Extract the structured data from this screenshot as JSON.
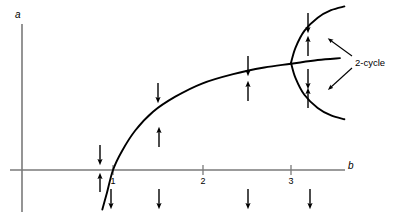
{
  "figure": {
    "title": "",
    "axes": {
      "y_label": "a",
      "x_label": "b",
      "x_ticks": [
        {
          "value": 1,
          "label": "1",
          "px": 113
        },
        {
          "value": 2,
          "label": "2",
          "px": 203
        },
        {
          "value": 3,
          "label": "3",
          "px": 291
        }
      ],
      "x_axis_y_px": 170,
      "y_axis_x_px": 22,
      "x_axis_start_px": 10,
      "x_axis_end_px": 345,
      "y_axis_top_px": 24,
      "y_axis_bottom_px": 212
    },
    "annotations": [
      {
        "name": "two-cycle-label",
        "text": "2-cycle",
        "x": 355,
        "y": 58
      }
    ],
    "colors": {
      "curve": "#000000",
      "axis": "#6e6e6e",
      "arrow": "#000000",
      "background": "#ffffff"
    }
  },
  "chart_data": {
    "type": "line",
    "title": "",
    "xlabel": "b",
    "ylabel": "a",
    "xlim": [
      0.0,
      3.6
    ],
    "ylim": [
      -0.45,
      1.7
    ],
    "grid": false,
    "legend": "none",
    "series": [
      {
        "name": "fixed-point-branch",
        "description": "nontrivial fixed point branch rising from b=1 through the transcritical point and continuing past b=3",
        "x": [
          0.88,
          0.93,
          1.0,
          1.1,
          1.25,
          1.45,
          1.7,
          2.0,
          2.35,
          2.7,
          3.0,
          3.3,
          3.55
        ],
        "y": [
          -0.42,
          -0.25,
          0.0,
          0.2,
          0.42,
          0.62,
          0.78,
          0.92,
          1.02,
          1.09,
          1.13,
          1.17,
          1.19
        ]
      },
      {
        "name": "two-cycle-upper-branch",
        "description": "upper arm of the period-doubling parabola opening rightward from the vertex at b=3",
        "x": [
          3.0,
          3.05,
          3.15,
          3.3,
          3.45,
          3.6
        ],
        "y": [
          1.14,
          1.3,
          1.48,
          1.62,
          1.7,
          1.74
        ]
      },
      {
        "name": "two-cycle-lower-branch",
        "description": "lower arm of the period-doubling parabola opening rightward from the vertex at b=3",
        "x": [
          3.0,
          3.05,
          3.15,
          3.3,
          3.45,
          3.6
        ],
        "y": [
          1.14,
          0.98,
          0.8,
          0.66,
          0.58,
          0.54
        ]
      }
    ],
    "arrows": [
      {
        "name": "arrow-1",
        "direction": "down",
        "x": 100,
        "y_top": 145,
        "y_bottom": 162
      },
      {
        "name": "arrow-2",
        "direction": "up",
        "x": 100,
        "y_top": 176,
        "y_bottom": 192
      },
      {
        "name": "arrow-3",
        "direction": "down",
        "x": 111,
        "y_top": 189,
        "y_bottom": 206
      },
      {
        "name": "arrow-4",
        "direction": "down",
        "x": 158,
        "y_top": 83,
        "y_bottom": 100
      },
      {
        "name": "arrow-5",
        "direction": "up",
        "x": 159,
        "y_top": 130,
        "y_bottom": 147
      },
      {
        "name": "arrow-6",
        "direction": "down",
        "x": 159,
        "y_top": 189,
        "y_bottom": 206
      },
      {
        "name": "arrow-7",
        "direction": "down",
        "x": 248,
        "y_top": 56,
        "y_bottom": 73
      },
      {
        "name": "arrow-8",
        "direction": "up",
        "x": 248,
        "y_top": 84,
        "y_bottom": 101
      },
      {
        "name": "arrow-9",
        "direction": "down",
        "x": 248,
        "y_top": 189,
        "y_bottom": 206
      },
      {
        "name": "arrow-10",
        "direction": "down",
        "x": 308,
        "y_top": 13,
        "y_bottom": 30
      },
      {
        "name": "arrow-11",
        "direction": "up",
        "x": 308,
        "y_top": 39,
        "y_bottom": 56
      },
      {
        "name": "arrow-12",
        "direction": "down",
        "x": 308,
        "y_top": 69,
        "y_bottom": 86
      },
      {
        "name": "arrow-13",
        "direction": "up",
        "x": 308,
        "y_top": 91,
        "y_bottom": 108
      },
      {
        "name": "arrow-14",
        "direction": "down",
        "x": 310,
        "y_top": 189,
        "y_bottom": 206
      }
    ],
    "pointer_arrows": [
      {
        "name": "pointer-to-upper-branch",
        "from_x": 352,
        "from_y": 56,
        "to_x": 330,
        "to_y": 40
      },
      {
        "name": "pointer-to-lower-branch",
        "from_x": 352,
        "from_y": 68,
        "to_x": 330,
        "to_y": 88
      }
    ]
  }
}
